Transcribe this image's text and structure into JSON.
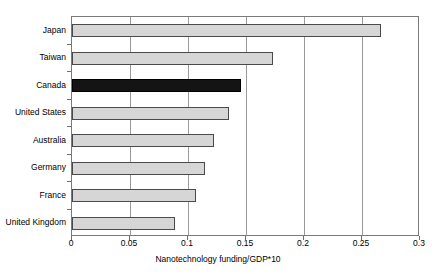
{
  "chart_data": {
    "type": "bar",
    "orientation": "horizontal",
    "title": "",
    "xlabel": "Nanotechnology funding/GDP*10",
    "ylabel": "",
    "xlim": [
      0,
      0.3
    ],
    "xticks": [
      "0",
      "0.05",
      "0.1",
      "0.15",
      "0.2",
      "0.25",
      "0.3"
    ],
    "xtick_values": [
      0,
      0.05,
      0.1,
      0.15,
      0.2,
      0.25,
      0.3
    ],
    "grid": "vertical",
    "legend": "none",
    "categories": [
      "Japan",
      "Taiwan",
      "Canada",
      "United States",
      "Australia",
      "Germany",
      "France",
      "United Kingdom"
    ],
    "values": [
      0.266,
      0.173,
      0.146,
      0.135,
      0.122,
      0.115,
      0.107,
      0.089
    ],
    "highlight_category": "Canada",
    "colors": {
      "bar_fill": "#d6d6d6",
      "bar_edge": "#4a4a4a",
      "highlight_fill": "#141414",
      "gridline": "#9a9a9a",
      "axis": "#7a7a7a",
      "text": "#000000",
      "background": "#ffffff"
    }
  }
}
